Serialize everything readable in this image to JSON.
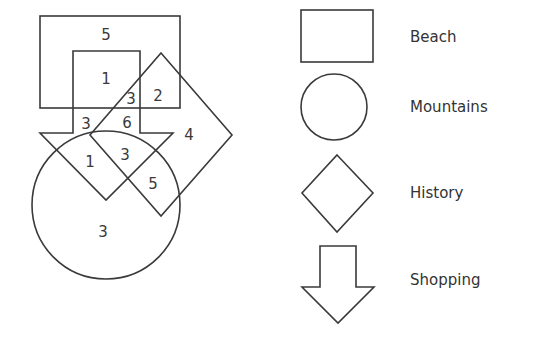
{
  "diagram": {
    "type": "venn-like region counts",
    "regions": [
      {
        "label": "5",
        "sets": [
          "Beach"
        ],
        "x": 106,
        "y": 35
      },
      {
        "label": "1",
        "sets": [
          "Beach",
          "Shopping"
        ],
        "x": 106,
        "y": 79
      },
      {
        "label": "3",
        "sets": [
          "Beach",
          "Shopping",
          "History"
        ],
        "x": 131,
        "y": 99
      },
      {
        "label": "2",
        "sets": [
          "Beach",
          "History"
        ],
        "x": 158,
        "y": 96
      },
      {
        "label": "3",
        "sets": [
          "Shopping"
        ],
        "x": 86,
        "y": 124
      },
      {
        "label": "6",
        "sets": [
          "Shopping",
          "History"
        ],
        "x": 127,
        "y": 123
      },
      {
        "label": "4",
        "sets": [
          "History"
        ],
        "x": 189,
        "y": 135
      },
      {
        "label": "1",
        "sets": [
          "Shopping",
          "Mountains"
        ],
        "x": 90,
        "y": 162
      },
      {
        "label": "3",
        "sets": [
          "Shopping",
          "History",
          "Mountains"
        ],
        "x": 125,
        "y": 155
      },
      {
        "label": "5",
        "sets": [
          "History",
          "Mountains"
        ],
        "x": 153,
        "y": 184
      },
      {
        "label": "3",
        "sets": [
          "Mountains"
        ],
        "x": 103,
        "y": 232
      }
    ]
  },
  "legend": {
    "items": [
      {
        "shape": "rectangle",
        "label": "Beach"
      },
      {
        "shape": "circle",
        "label": "Mountains"
      },
      {
        "shape": "diamond",
        "label": "History"
      },
      {
        "shape": "down-arrow",
        "label": "Shopping"
      }
    ]
  },
  "colors": {
    "stroke": "#3a3a3a",
    "text": "#333333",
    "background": "#ffffff"
  }
}
